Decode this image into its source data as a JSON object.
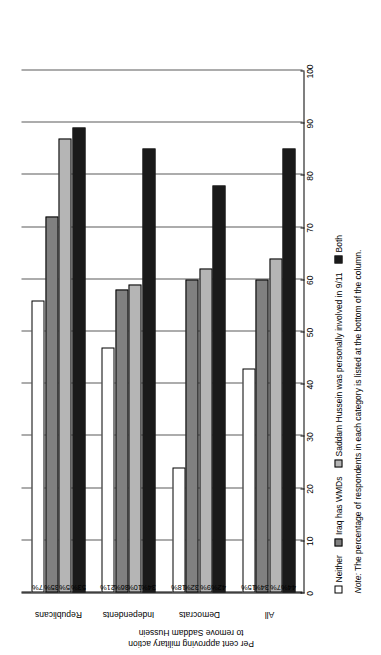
{
  "chart_data": {
    "type": "bar",
    "orientation": "horizontal",
    "title": "",
    "xlabel": "",
    "ylabel": "Per cent approving military action to remove Saddam Hussein",
    "ylim": [
      0,
      100
    ],
    "yticks": [
      0,
      10,
      20,
      30,
      40,
      50,
      60,
      70,
      80,
      90,
      100
    ],
    "grid": true,
    "legend_position": "bottom",
    "categories": [
      "Republicans",
      "Independents",
      "Democrats",
      "All"
    ],
    "series": [
      {
        "name": "Neither",
        "color": "#ffffff",
        "values": [
          56,
          47,
          24,
          43
        ],
        "labels": [
          "7%",
          "21%",
          "18%",
          "15%"
        ]
      },
      {
        "name": "Iraq has WMDs",
        "color": "#808080",
        "values": [
          72,
          58,
          60,
          60
        ],
        "labels": [
          "35%",
          "36%",
          "32%",
          "34%"
        ]
      },
      {
        "name": "Saddam Hussein was personally involved in 9/11",
        "color": "#b5b5b5",
        "values": [
          87,
          59,
          62,
          64
        ],
        "labels": [
          "5%",
          "10%",
          "9%",
          "7%"
        ]
      },
      {
        "name": "Both",
        "color": "#1a1a1a",
        "values": [
          89,
          85,
          78,
          85
        ],
        "labels": [
          "53%",
          "34%",
          "42%",
          "44%"
        ]
      }
    ]
  },
  "axis": {
    "title_line1": "Per cent approving military action",
    "title_line2": "to remove Saddam Hussein",
    "tick_labels": [
      "100",
      "90",
      "80",
      "70",
      "60",
      "50",
      "40",
      "30",
      "20",
      "10",
      "0"
    ]
  },
  "legend": {
    "items": [
      {
        "label": "Neither",
        "key": "neither"
      },
      {
        "label": "Iraq has WMDs",
        "key": "wmd"
      },
      {
        "label": "Saddam Hussein was personally involved in 9/11",
        "key": "nine11"
      },
      {
        "label": "Both",
        "key": "both"
      }
    ]
  },
  "note": {
    "lead": "Note:",
    "text": " The percentage of respondents in each category is listed at the bottom of the column."
  },
  "colors": {
    "neither": "#ffffff",
    "wmd": "#808080",
    "nine11": "#b5b5b5",
    "both": "#1a1a1a",
    "axis": "#000000",
    "grid": "#5a5a5a"
  }
}
